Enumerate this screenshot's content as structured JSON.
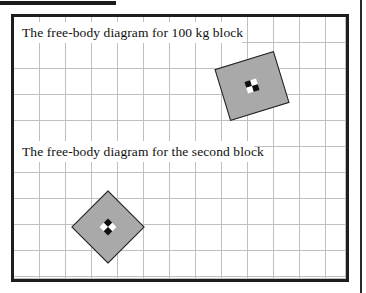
{
  "figure": {
    "panels": [
      {
        "caption": "The free-body diagram for 100 kg block",
        "block": {
          "name": "block-100kg",
          "shape": "square",
          "fill_color": "#a9a9a9",
          "stroke_color": "#1f1f1f",
          "rotation_degrees": -17,
          "center_marker": "center-of-mass-marker"
        }
      },
      {
        "caption": "The free-body diagram for the second block",
        "block": {
          "name": "block-second",
          "shape": "square",
          "fill_color": "#a9a9a9",
          "stroke_color": "#1f1f1f",
          "rotation_degrees": 45,
          "center_marker": "center-of-mass-marker"
        }
      }
    ],
    "grid": {
      "visible": true,
      "cell_size_px": 26,
      "line_color": "#8e8e8e"
    },
    "frame": {
      "border_color": "#1d1d1d",
      "background_color": "#ffffff"
    },
    "rules": {
      "top_bar_color": "#1b1b1b",
      "right_bar_color": "#2a2a2a"
    }
  }
}
